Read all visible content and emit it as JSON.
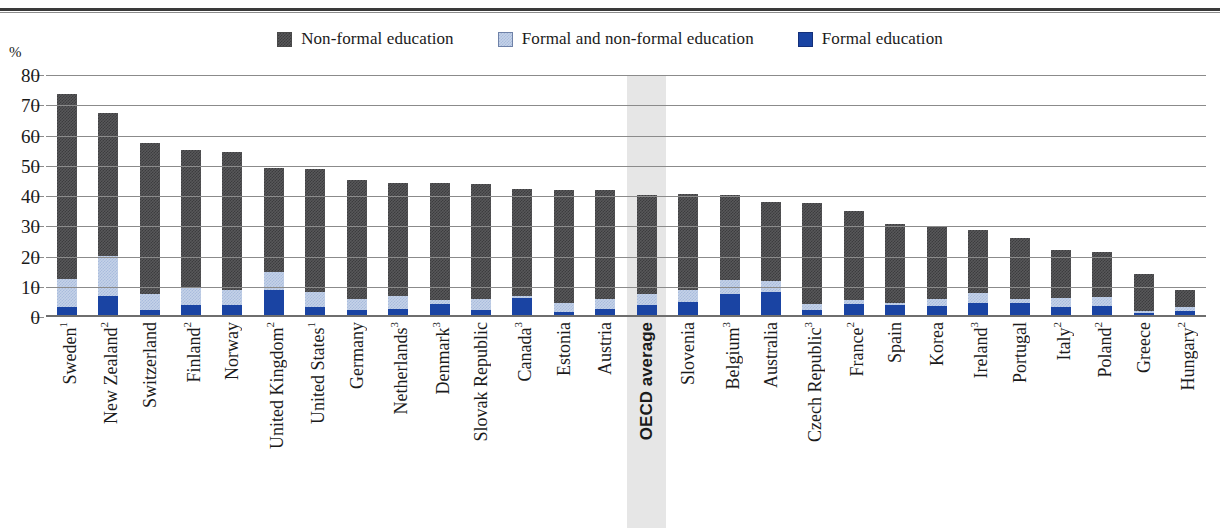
{
  "axis": {
    "y_unit": "%",
    "y_ticks": [
      0,
      10,
      20,
      30,
      40,
      50,
      60,
      70,
      80
    ]
  },
  "legend": {
    "items": [
      {
        "label": "Non-formal education",
        "icon": "square-swatch-dark-gray",
        "color": "#58585a"
      },
      {
        "label": "Formal and non-formal education",
        "icon": "square-swatch-light-blue",
        "color": "#c5d2e8"
      },
      {
        "label": "Formal education",
        "icon": "square-swatch-blue",
        "color": "#1a44a3"
      }
    ]
  },
  "chart_data": {
    "type": "bar",
    "title": "",
    "subtitle": "",
    "xlabel": "",
    "ylabel": "%",
    "ylim": [
      0,
      80
    ],
    "grid": true,
    "legend_position": "top-center",
    "stacked": true,
    "highlight_category": "OECD average",
    "categories": [
      "Sweden",
      "New Zealand",
      "Switzerland",
      "Finland",
      "Norway",
      "United Kingdom",
      "United States",
      "Germany",
      "Netherlands",
      "Denmark",
      "Slovak Republic",
      "Canada",
      "Estonia",
      "Austria",
      "OECD average",
      "Slovenia",
      "Belgium",
      "Australia",
      "Czech Republic",
      "France",
      "Spain",
      "Korea",
      "Ireland",
      "Portugal",
      "Italy",
      "Poland",
      "Greece",
      "Hungary"
    ],
    "category_footnotes": [
      "1",
      "2",
      "",
      "2",
      "",
      "2",
      "1",
      "",
      "3",
      "3",
      "",
      "3",
      "",
      "",
      "",
      "",
      "3",
      "",
      "3",
      "2",
      "",
      "",
      "3",
      "",
      "2",
      "2",
      "",
      "2"
    ],
    "series": [
      {
        "name": "Formal education",
        "color": "#1a44a3",
        "values": [
          3.4,
          6.8,
          2.2,
          4.0,
          4.0,
          9.0,
          3.2,
          2.4,
          2.8,
          4.4,
          2.4,
          6.2,
          1.8,
          2.6,
          4.0,
          4.8,
          7.6,
          8.2,
          2.4,
          4.2,
          4.0,
          3.8,
          4.6,
          4.6,
          3.4,
          3.6,
          1.4,
          2.0
        ]
      },
      {
        "name": "Formal and non-formal education",
        "color": "#c5d2e8",
        "values": [
          9.2,
          13.4,
          5.4,
          5.8,
          5.0,
          5.8,
          5.0,
          3.4,
          4.0,
          1.2,
          3.6,
          0.6,
          3.0,
          3.2,
          3.6,
          4.0,
          4.8,
          3.6,
          2.0,
          1.4,
          0.6,
          2.0,
          3.4,
          1.4,
          3.0,
          3.0,
          0.6,
          1.2
        ]
      },
      {
        "name": "Non-formal education",
        "color": "#58585a",
        "values": [
          61.0,
          47.2,
          49.8,
          45.4,
          45.6,
          34.4,
          40.8,
          39.4,
          37.6,
          38.6,
          38.0,
          35.4,
          37.2,
          36.2,
          32.6,
          31.8,
          28.0,
          26.2,
          33.2,
          29.4,
          26.2,
          24.2,
          20.8,
          20.2,
          15.6,
          15.0,
          12.2,
          5.6
        ]
      }
    ],
    "totals": [
      73.6,
      67.4,
      57.4,
      55.2,
      54.6,
      49.2,
      49.0,
      45.2,
      44.4,
      44.2,
      44.0,
      42.2,
      42.0,
      42.0,
      40.2,
      40.6,
      40.4,
      38.0,
      37.6,
      35.0,
      30.8,
      30.0,
      28.8,
      26.2,
      22.0,
      21.6,
      14.2,
      8.8
    ]
  }
}
